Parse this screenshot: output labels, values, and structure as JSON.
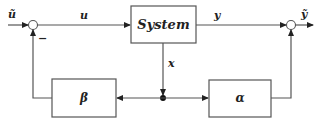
{
  "diagram": {
    "blocks": {
      "system": "System",
      "beta": "β",
      "alpha": "α"
    },
    "signals": {
      "u_tilde": "ũ",
      "u": "u",
      "y": "y",
      "y_tilde": "ỹ",
      "x": "x"
    },
    "junction_signs": {
      "left_feedback": "−"
    }
  }
}
